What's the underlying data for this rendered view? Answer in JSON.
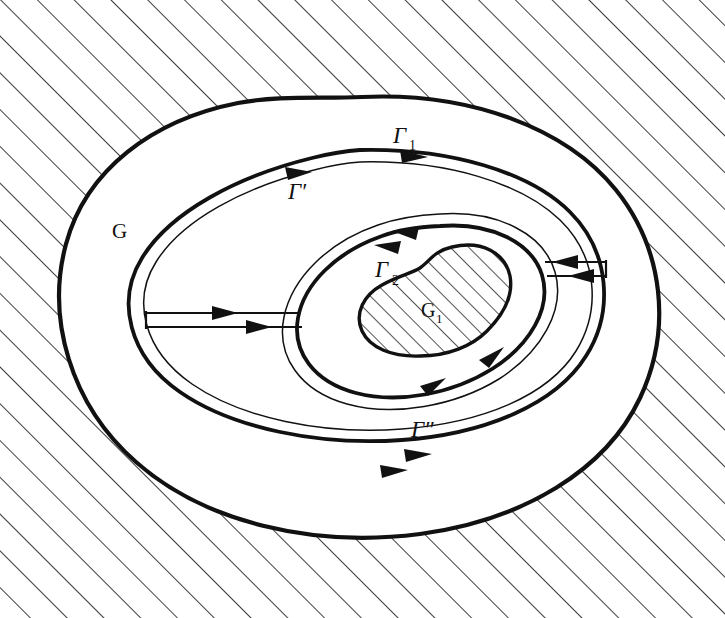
{
  "figure": {
    "name": "multiply-connected-domain-with-cuts",
    "background_color": "#ffffff",
    "ink_color": "#111111",
    "hatch_color": "#1a1a1a"
  },
  "labels": {
    "outer_domain": "G",
    "inner_hole": "G",
    "inner_hole_sub": "1",
    "gamma_outer": "Γ",
    "gamma_outer_sub": "1",
    "gamma_prime": "Γ′",
    "gamma_double_prime": "Γ″",
    "gamma_inner": "Γ",
    "gamma_inner_sub": "2"
  },
  "regions": [
    {
      "name": "exterior-hatched",
      "label": "",
      "hatched": true,
      "description": "region outside Γ₁"
    },
    {
      "name": "domain-G",
      "label": "G",
      "hatched": false,
      "description": "annular domain between Γ₁ and the inner boundary"
    },
    {
      "name": "hole-G1",
      "label": "G₁",
      "hatched": true,
      "description": "excluded kidney-shaped island"
    }
  ],
  "contours": [
    {
      "name": "gamma-1",
      "label": "Γ₁",
      "direction": "right",
      "style": "heavy"
    },
    {
      "name": "gamma-prime",
      "label": "Γ′",
      "direction": "right",
      "style": "heavy"
    },
    {
      "name": "gamma-double-prime",
      "label": "Γ″",
      "direction": "right",
      "style": "heavy"
    },
    {
      "name": "gamma-2",
      "label": "Γ₂",
      "direction": "left",
      "style": "heavy"
    }
  ],
  "cuts": [
    {
      "name": "left-cut",
      "arrows": [
        "right",
        "right"
      ]
    },
    {
      "name": "right-cut",
      "arrows": [
        "left",
        "left"
      ]
    }
  ],
  "hatching": {
    "angle_deg": 45,
    "spacing_px": 26,
    "stroke_width": 1.6
  }
}
